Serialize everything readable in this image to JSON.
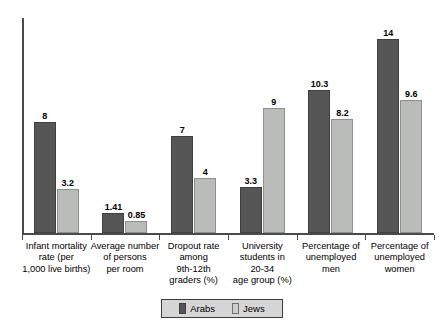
{
  "chart_data": {
    "type": "bar",
    "title": "",
    "subtitle": "",
    "xlabel": "",
    "ylabel": "",
    "ylim": [
      0,
      15.5
    ],
    "grid": false,
    "legend_position": "bottom-center",
    "categories": [
      "Infant mortality rate (per 1,000 live births)",
      "Average number of persons per room",
      "Dropout rate among 9th-12th graders (%)",
      "University students in 20-34 age group (%)",
      "Percentage of unemployed men",
      "Percentage of unemployed women"
    ],
    "category_label_lines": [
      [
        "Infant mortality",
        "rate (per",
        "1,000 live births)"
      ],
      [
        "Average number",
        "of persons",
        "per room"
      ],
      [
        "Dropout rate",
        "among",
        "9th-12th",
        "graders (%)"
      ],
      [
        "University",
        "students in",
        "20-34",
        "age group (%)"
      ],
      [
        "Percentage of",
        "unemployed",
        "men"
      ],
      [
        "Percentage of",
        "unemployed",
        "women"
      ]
    ],
    "series": [
      {
        "name": "Arabs",
        "color": "#565656",
        "values": [
          8,
          1.41,
          7,
          3.3,
          10.3,
          14
        ],
        "labels": [
          "8",
          "1.41",
          "7",
          "3.3",
          "10.3",
          "14"
        ]
      },
      {
        "name": "Jews",
        "color": "#b9bcb9",
        "values": [
          3.2,
          0.85,
          4,
          9,
          8.2,
          9.6
        ],
        "labels": [
          "3.2",
          "0.85",
          "4",
          "9",
          "8.2",
          "9.6"
        ]
      }
    ]
  },
  "legend": {
    "items": [
      {
        "label": "Arabs",
        "swatch": "legend-swatch-arabs"
      },
      {
        "label": "Jews",
        "swatch": "legend-swatch-jews"
      }
    ]
  }
}
